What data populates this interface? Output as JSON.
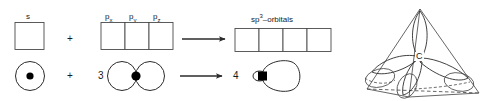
{
  "diagram": {
    "stroke_color": "#2b2b2b",
    "fill_color": "#000000",
    "background": "#ffffff"
  },
  "box_row": {
    "s_label": "s",
    "p_labels": [
      "p",
      "p",
      "p"
    ],
    "p_subscripts": [
      "x",
      "y",
      "z"
    ],
    "hybrid_label_base": "sp",
    "hybrid_label_sup": "3",
    "hybrid_label_tail": "–orbitals",
    "s_boxes": 1,
    "p_boxes": 3,
    "hybrid_boxes": 4
  },
  "operators": {
    "plus_top": "+",
    "plus_bottom": "+",
    "count_p": "3",
    "count_hybrid": "4"
  },
  "orbital_row": {
    "s_orbital_name": "s-orbital sphere with nucleus",
    "p_orbital_name": "p-orbital dumbbell with nucleus",
    "hybrid_orbital_name": "sp3 teardrop orbital with nucleus"
  },
  "tetrahedron": {
    "center_atom_label": "C",
    "description": "tetrahedral arrangement of four sp3 orbitals around carbon"
  }
}
